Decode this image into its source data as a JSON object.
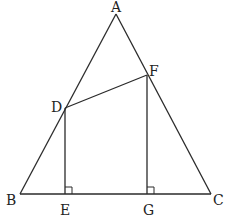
{
  "figure": {
    "points": {
      "A": {
        "label": "A",
        "x": 116,
        "y": 14
      },
      "B": {
        "label": "B",
        "x": 20,
        "y": 194
      },
      "C": {
        "label": "C",
        "x": 211,
        "y": 194
      },
      "D": {
        "label": "D",
        "x": 65,
        "y": 108
      },
      "F": {
        "label": "F",
        "x": 147,
        "y": 75
      },
      "E": {
        "label": "E",
        "x": 66,
        "y": 194
      },
      "G": {
        "label": "G",
        "x": 148,
        "y": 194
      }
    },
    "segments": [
      "AB",
      "AC",
      "BC",
      "DF",
      "DE",
      "FG"
    ],
    "right_angles": [
      "DEB",
      "FGB"
    ],
    "line_color": "#2a2a2a"
  }
}
